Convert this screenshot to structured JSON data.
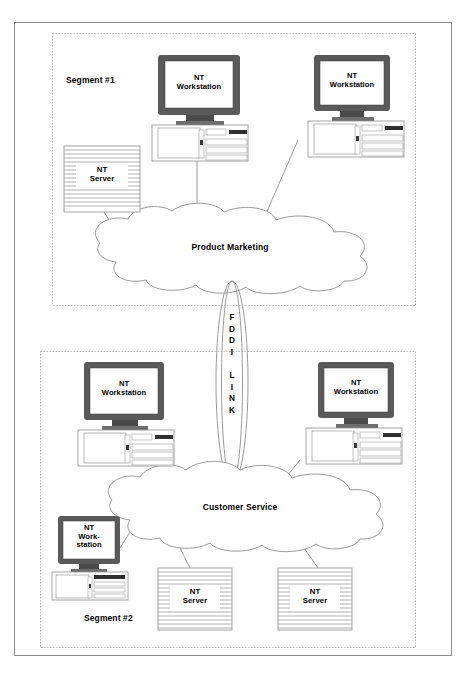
{
  "diagram": {
    "outer_frame": {
      "name": "outer-border"
    },
    "segments": [
      {
        "id": "segment-1",
        "label": "Segment #1"
      },
      {
        "id": "segment-2",
        "label": "Segment #2"
      }
    ],
    "clouds": [
      {
        "id": "cloud-product-marketing",
        "label": "Product Marketing"
      },
      {
        "id": "cloud-customer-service",
        "label": "Customer Service"
      }
    ],
    "backbone": {
      "id": "fddi-link",
      "label": "F\nD\nD\nI\n\nL\nI\nN\nK",
      "letters": [
        "F",
        "D",
        "D",
        "I",
        "",
        "L",
        "I",
        "N",
        "K"
      ],
      "name": "FDDI LINK"
    },
    "nodes": [
      {
        "id": "ws-seg1-left",
        "type": "workstation",
        "label": "NT\nWorkstation",
        "segment": "segment-1"
      },
      {
        "id": "ws-seg1-right",
        "type": "workstation",
        "label": "NT\nWorkstation",
        "segment": "segment-1"
      },
      {
        "id": "srv-seg1-left",
        "type": "server",
        "label": "NT\nServer",
        "segment": "segment-1"
      },
      {
        "id": "ws-seg2-left",
        "type": "workstation",
        "label": "NT\nWorkstation",
        "segment": "segment-2"
      },
      {
        "id": "ws-seg2-right",
        "type": "workstation",
        "label": "NT\nWorkstation",
        "segment": "segment-2"
      },
      {
        "id": "ws-seg2-small",
        "type": "workstation",
        "label": "NT\nWork-\nstation",
        "segment": "segment-2"
      },
      {
        "id": "srv-seg2-mid",
        "type": "server",
        "label": "NT\nServer",
        "segment": "segment-2"
      },
      {
        "id": "srv-seg2-right",
        "type": "server",
        "label": "NT\nServer",
        "segment": "segment-2"
      }
    ],
    "colors": {
      "line": "#808080",
      "monitor_bezel": "#5a5a5a",
      "screen": "#ffffff",
      "text": "#000000",
      "frame": "#999999",
      "dotted": "#b3b3b3",
      "server_stripe": "#808080",
      "accent_dark": "#333333"
    }
  }
}
